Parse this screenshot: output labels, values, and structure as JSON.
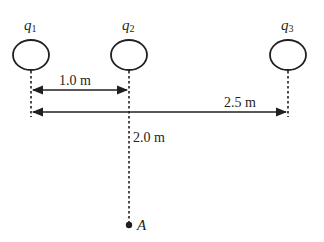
{
  "diagram": {
    "charges": [
      {
        "id": "q1",
        "symbol": "q",
        "subscript": "1"
      },
      {
        "id": "q2",
        "symbol": "q",
        "subscript": "2"
      },
      {
        "id": "q3",
        "symbol": "q",
        "subscript": "3"
      }
    ],
    "distances": {
      "q1_to_q2": "1.0 m",
      "q1_to_q3": "2.5 m",
      "q2_to_A": "2.0 m"
    },
    "point": {
      "label": "A"
    },
    "colors": {
      "ink": "#231f20",
      "background": "#ffffff"
    }
  }
}
